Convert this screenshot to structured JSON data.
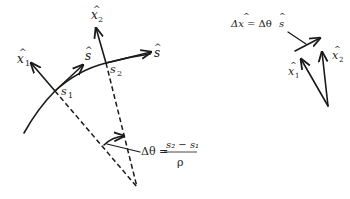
{
  "diagram": {
    "left": {
      "labels": {
        "x1": "x",
        "x1_sub": "1",
        "x2": "x",
        "x2_sub": "2",
        "s_hat_1": "s",
        "s_hat_2": "s",
        "s1": "s",
        "s1_sub": "1",
        "s2": "s",
        "s2_sub": "2",
        "hat": "^"
      },
      "angle_equation": {
        "lhs": "Δθ =",
        "numerator": "s₂ − s₁",
        "denominator": "ρ"
      }
    },
    "right": {
      "equation": {
        "lhs": "Δx",
        "mid": "= Δθ",
        "rhs": "s"
      },
      "labels": {
        "x1": "x",
        "x1_sub": "1",
        "x2": "x",
        "x2_sub": "2",
        "hat": "^"
      }
    },
    "colors": {
      "ink": "#1a1a1a",
      "background": "#ffffff"
    }
  }
}
